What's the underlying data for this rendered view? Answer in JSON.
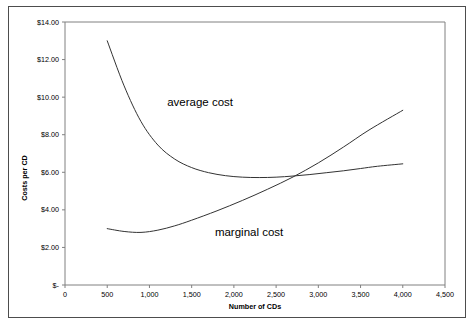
{
  "chart_data": {
    "type": "line",
    "title": "",
    "xlabel": "Number of CDs",
    "ylabel": "Costs per CD",
    "xlim": [
      0,
      4500
    ],
    "ylim": [
      0,
      14
    ],
    "grid": false,
    "legend": "inline-labels",
    "xticks": [
      "0",
      "500",
      "1,000",
      "1,500",
      "2,000",
      "2,500",
      "3,000",
      "3,500",
      "4,000",
      "4,500"
    ],
    "xtick_values": [
      0,
      500,
      1000,
      1500,
      2000,
      2500,
      3000,
      3500,
      4000,
      4500
    ],
    "yticks": [
      "$-",
      "$2.00",
      "$4.00",
      "$6.00",
      "$8.00",
      "$10.00",
      "$12.00",
      "$14.00"
    ],
    "ytick_values": [
      0,
      2,
      4,
      6,
      8,
      10,
      12,
      14
    ],
    "series": [
      {
        "name": "average cost",
        "label": "average cost",
        "label_x": 1600,
        "label_y": 9.55,
        "color": "#333333",
        "x": [
          500,
          700,
          900,
          1100,
          1300,
          1500,
          1700,
          1900,
          2100,
          2300,
          2500,
          2700,
          2900,
          3100,
          3300,
          3500,
          3700,
          4000
        ],
        "y": [
          13.0,
          10.6,
          8.7,
          7.45,
          6.7,
          6.25,
          5.98,
          5.82,
          5.74,
          5.72,
          5.74,
          5.8,
          5.88,
          5.98,
          6.08,
          6.2,
          6.32,
          6.45
        ]
      },
      {
        "name": "marginal cost",
        "label": "marginal cost",
        "label_x": 2180,
        "label_y": 2.6,
        "color": "#333333",
        "x": [
          500,
          700,
          900,
          1100,
          1300,
          1500,
          1800,
          2100,
          2400,
          2700,
          3000,
          3300,
          3600,
          4000
        ],
        "y": [
          3.0,
          2.85,
          2.8,
          2.92,
          3.15,
          3.45,
          3.95,
          4.5,
          5.1,
          5.75,
          6.5,
          7.35,
          8.25,
          9.3
        ]
      }
    ],
    "annotations": [
      {
        "text": "average cost",
        "x": 1600,
        "y": 9.55
      },
      {
        "text": "marginal cost",
        "x": 2180,
        "y": 2.6
      }
    ],
    "intersection": {
      "x": 2700,
      "y": 5.78
    }
  },
  "colors": {
    "curve": "#333333",
    "axis": "#808080",
    "frame": "#4d4d4d",
    "background": "#ffffff"
  }
}
